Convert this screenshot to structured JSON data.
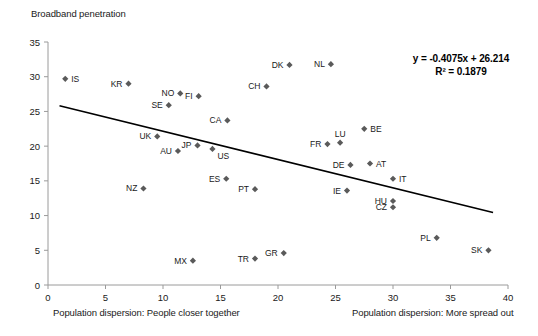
{
  "chart_data": {
    "type": "scatter",
    "title": "",
    "ylabel": "Broadband penetration",
    "xlabel_left": "Population dispersion: People closer together",
    "xlabel_right": "Population dispersion: More spread out",
    "xlim": [
      0,
      40
    ],
    "ylim": [
      0,
      35
    ],
    "xticks": [
      0,
      5,
      10,
      15,
      20,
      25,
      30,
      35,
      40
    ],
    "yticks": [
      0,
      5,
      10,
      15,
      20,
      25,
      30,
      35
    ],
    "grid": false,
    "legend": "none",
    "marker_color": "#5a5a5a",
    "trendline_color": "#000000",
    "annotations": {
      "equation": "y = -0.4075x + 26.214",
      "r_squared": "R² = 0.1879"
    },
    "trendline": {
      "slope": -0.4075,
      "intercept": 26.214,
      "x_start": 1.0,
      "x_end": 38.7
    },
    "points": [
      {
        "label": "IS",
        "x": 1.5,
        "y": 29.7,
        "label_pos": "right"
      },
      {
        "label": "KR",
        "x": 7.0,
        "y": 29.0,
        "label_pos": "left"
      },
      {
        "label": "NO",
        "x": 11.5,
        "y": 27.6,
        "label_pos": "left"
      },
      {
        "label": "FI",
        "x": 13.1,
        "y": 27.2,
        "label_pos": "left"
      },
      {
        "label": "SE",
        "x": 10.5,
        "y": 25.9,
        "label_pos": "left"
      },
      {
        "label": "DK",
        "x": 21.0,
        "y": 31.7,
        "label_pos": "left"
      },
      {
        "label": "NL",
        "x": 24.6,
        "y": 31.8,
        "label_pos": "left"
      },
      {
        "label": "CH",
        "x": 19.0,
        "y": 28.6,
        "label_pos": "left"
      },
      {
        "label": "CA",
        "x": 15.6,
        "y": 23.7,
        "label_pos": "left"
      },
      {
        "label": "UK",
        "x": 9.5,
        "y": 21.4,
        "label_pos": "left"
      },
      {
        "label": "AU",
        "x": 11.3,
        "y": 19.3,
        "label_pos": "left"
      },
      {
        "label": "JP",
        "x": 13.0,
        "y": 20.1,
        "label_pos": "left"
      },
      {
        "label": "US",
        "x": 14.3,
        "y": 19.6,
        "label_pos": "belowright"
      },
      {
        "label": "BE",
        "x": 27.5,
        "y": 22.5,
        "label_pos": "right"
      },
      {
        "label": "FR",
        "x": 24.3,
        "y": 20.3,
        "label_pos": "left"
      },
      {
        "label": "LU",
        "x": 25.4,
        "y": 20.5,
        "label_pos": "above"
      },
      {
        "label": "DE",
        "x": 26.3,
        "y": 17.3,
        "label_pos": "left"
      },
      {
        "label": "AT",
        "x": 28.0,
        "y": 17.5,
        "label_pos": "right"
      },
      {
        "label": "IT",
        "x": 30.0,
        "y": 15.3,
        "label_pos": "right"
      },
      {
        "label": "IE",
        "x": 26.0,
        "y": 13.6,
        "label_pos": "left"
      },
      {
        "label": "HU",
        "x": 30.0,
        "y": 12.1,
        "label_pos": "left"
      },
      {
        "label": "CZ",
        "x": 30.0,
        "y": 11.2,
        "label_pos": "left"
      },
      {
        "label": "NZ",
        "x": 8.3,
        "y": 13.9,
        "label_pos": "left"
      },
      {
        "label": "ES",
        "x": 15.5,
        "y": 15.3,
        "label_pos": "left"
      },
      {
        "label": "PT",
        "x": 18.0,
        "y": 13.8,
        "label_pos": "left"
      },
      {
        "label": "MX",
        "x": 12.6,
        "y": 3.5,
        "label_pos": "left"
      },
      {
        "label": "TR",
        "x": 18.0,
        "y": 3.8,
        "label_pos": "left"
      },
      {
        "label": "GR",
        "x": 20.5,
        "y": 4.6,
        "label_pos": "left"
      },
      {
        "label": "PL",
        "x": 33.8,
        "y": 6.8,
        "label_pos": "left"
      },
      {
        "label": "SK",
        "x": 38.3,
        "y": 5.0,
        "label_pos": "left"
      }
    ]
  }
}
